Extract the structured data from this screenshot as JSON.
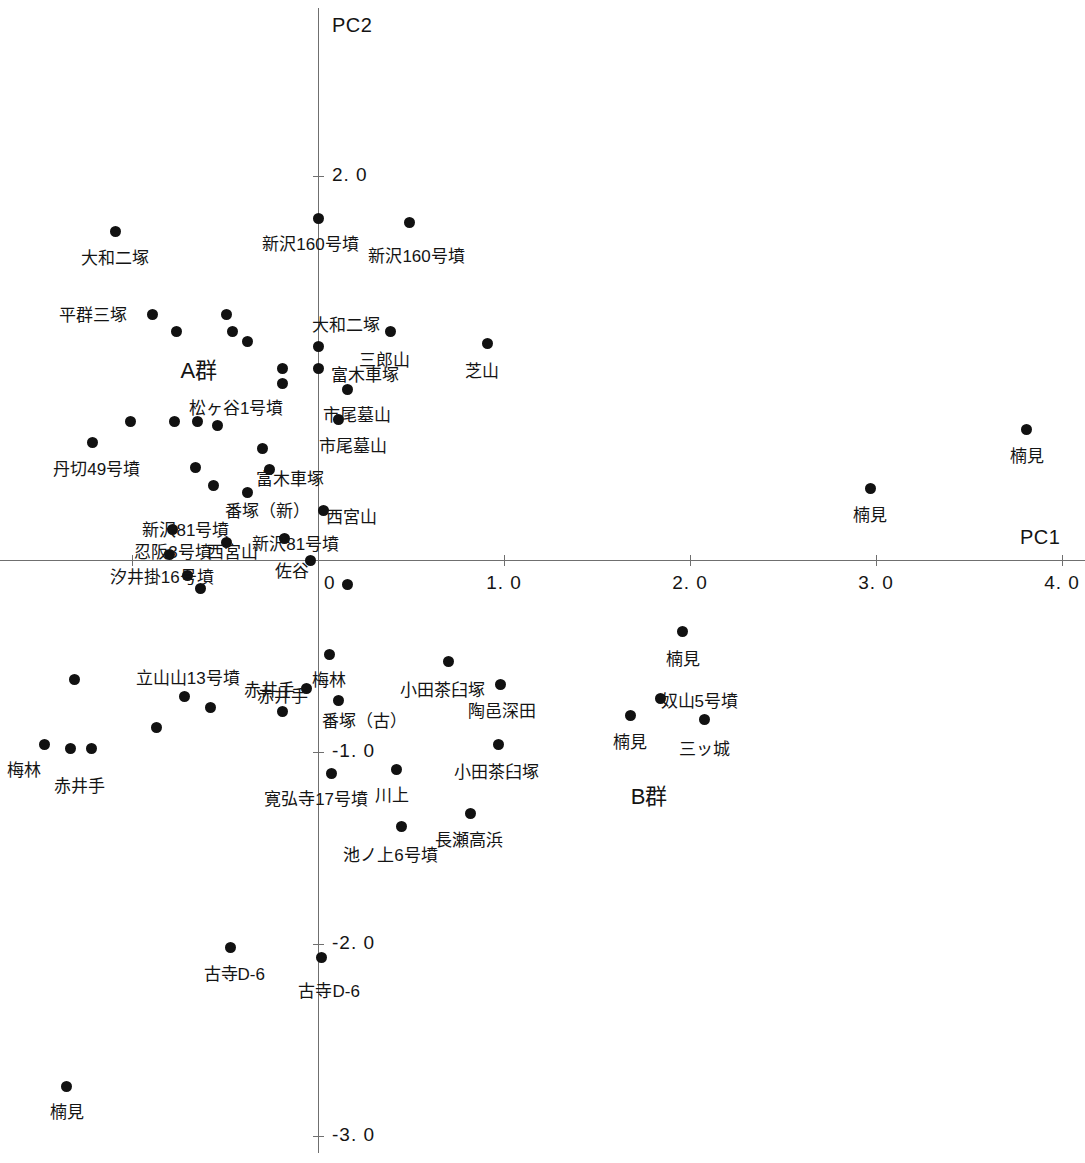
{
  "chart_data": {
    "type": "scatter",
    "title": "",
    "xlabel": "PC1",
    "ylabel": "PC2",
    "xlim": [
      -1.71,
      4.12
    ],
    "ylim": [
      -3.14,
      2.8
    ],
    "grid": false,
    "legend": null,
    "xticks": [
      {
        "value": 0,
        "label": "0"
      },
      {
        "value": 1.0,
        "label": "1. 0"
      },
      {
        "value": 2.0,
        "label": "2. 0"
      },
      {
        "value": 3.0,
        "label": "3. 0"
      },
      {
        "value": 4.0,
        "label": "4. 0"
      }
    ],
    "xticks_unlabeled": [
      -1.0
    ],
    "yticks": [
      {
        "value": 2.0,
        "label": "2. 0"
      },
      {
        "value": -1.0,
        "label": "-1. 0"
      },
      {
        "value": -2.0,
        "label": "-2. 0"
      },
      {
        "value": -3.0,
        "label": "-3. 0"
      }
    ],
    "cluster_annotations": [
      {
        "text": "A群",
        "x": -0.64,
        "y": 1.0
      },
      {
        "text": "B群",
        "x": 1.78,
        "y": -1.22
      }
    ],
    "points": [
      {
        "label": "大和二塚",
        "x": -1.09,
        "y": 1.71,
        "lx": -1.09,
        "ly": 1.6
      },
      {
        "label": "新沢160号墳",
        "x": 0.0,
        "y": 1.78,
        "lx": -0.04,
        "ly": 1.67
      },
      {
        "label": "新沢160号墳",
        "x": 0.49,
        "y": 1.76,
        "lx": 0.53,
        "ly": 1.61
      },
      {
        "label": "平群三塚",
        "x": -0.89,
        "y": 1.28,
        "lx": -1.21,
        "ly": 1.3
      },
      {
        "label": "",
        "x": -0.76,
        "y": 1.19,
        "lx": null,
        "ly": null
      },
      {
        "label": "",
        "x": -0.49,
        "y": 1.28,
        "lx": null,
        "ly": null
      },
      {
        "label": "",
        "x": -0.46,
        "y": 1.19,
        "lx": null,
        "ly": null
      },
      {
        "label": "",
        "x": -0.38,
        "y": 1.14,
        "lx": null,
        "ly": null
      },
      {
        "label": "大和二塚",
        "x": 0.0,
        "y": 1.11,
        "lx": 0.15,
        "ly": 1.25
      },
      {
        "label": "三郎山",
        "x": 0.39,
        "y": 1.19,
        "lx": 0.36,
        "ly": 1.07
      },
      {
        "label": "芝山",
        "x": 0.91,
        "y": 1.13,
        "lx": 0.88,
        "ly": 1.01
      },
      {
        "label": "",
        "x": -0.19,
        "y": 1.0,
        "lx": null,
        "ly": null
      },
      {
        "label": "富木車塚",
        "x": 0.0,
        "y": 1.0,
        "lx": 0.25,
        "ly": 0.99
      },
      {
        "label": "",
        "x": -0.19,
        "y": 0.92,
        "lx": null,
        "ly": null
      },
      {
        "label": "市尾墓山",
        "x": 0.16,
        "y": 0.89,
        "lx": 0.21,
        "ly": 0.78
      },
      {
        "label": "市尾墓山",
        "x": 0.11,
        "y": 0.73,
        "lx": 0.19,
        "ly": 0.62
      },
      {
        "label": "",
        "x": -1.01,
        "y": 0.72,
        "lx": null,
        "ly": null
      },
      {
        "label": "",
        "x": -0.77,
        "y": 0.72,
        "lx": null,
        "ly": null
      },
      {
        "label": "",
        "x": -0.65,
        "y": 0.72,
        "lx": null,
        "ly": null
      },
      {
        "label": "松ヶ谷1号墳",
        "x": -0.54,
        "y": 0.7,
        "lx": -0.44,
        "ly": 0.82
      },
      {
        "label": "丹切49号墳",
        "x": -1.21,
        "y": 0.61,
        "lx": -1.19,
        "ly": 0.5
      },
      {
        "label": "",
        "x": -0.3,
        "y": 0.58,
        "lx": null,
        "ly": null
      },
      {
        "label": "",
        "x": -0.66,
        "y": 0.48,
        "lx": null,
        "ly": null
      },
      {
        "label": "富木車塚",
        "x": -0.26,
        "y": 0.47,
        "lx": -0.15,
        "ly": 0.45
      },
      {
        "label": "",
        "x": -0.56,
        "y": 0.39,
        "lx": null,
        "ly": null
      },
      {
        "label": "番塚（新）",
        "x": -0.38,
        "y": 0.35,
        "lx": -0.27,
        "ly": 0.28
      },
      {
        "label": "西宮山",
        "x": 0.03,
        "y": 0.26,
        "lx": 0.18,
        "ly": 0.25
      },
      {
        "label": "新沢81号墳",
        "x": -0.78,
        "y": 0.16,
        "lx": -0.71,
        "ly": 0.18
      },
      {
        "label": "新沢81号墳",
        "x": -0.18,
        "y": 0.11,
        "lx": -0.12,
        "ly": 0.11
      },
      {
        "label": "忍阪3号墳",
        "x": -0.8,
        "y": 0.03,
        "lx": -0.78,
        "ly": 0.07
      },
      {
        "label": "西宮山",
        "x": -0.49,
        "y": 0.09,
        "lx": -0.46,
        "ly": 0.07
      },
      {
        "label": "佐谷",
        "x": -0.04,
        "y": 0.0,
        "lx": -0.14,
        "ly": -0.03
      },
      {
        "label": "汐井掛16号墳",
        "x": -0.7,
        "y": -0.08,
        "lx": -0.84,
        "ly": -0.06
      },
      {
        "label": "",
        "x": -0.63,
        "y": -0.15,
        "lx": null,
        "ly": null
      },
      {
        "label": "",
        "x": 0.16,
        "y": -0.13,
        "lx": null,
        "ly": null
      },
      {
        "label": "楠見",
        "x": 3.81,
        "y": 0.68,
        "lx": 3.81,
        "ly": 0.57
      },
      {
        "label": "楠見",
        "x": 2.97,
        "y": 0.37,
        "lx": 2.97,
        "ly": 0.26
      },
      {
        "label": "梅林",
        "x": 0.06,
        "y": -0.49,
        "lx": 0.06,
        "ly": -0.6
      },
      {
        "label": "赤井手",
        "x": -0.06,
        "y": -0.67,
        "lx": -0.26,
        "ly": -0.65
      },
      {
        "label": "番塚（古）",
        "x": 0.11,
        "y": -0.73,
        "lx": 0.25,
        "ly": -0.81
      },
      {
        "label": "小田茶臼塚",
        "x": 0.7,
        "y": -0.53,
        "lx": 0.67,
        "ly": -0.65
      },
      {
        "label": "陶邑深田",
        "x": 0.98,
        "y": -0.65,
        "lx": 0.99,
        "ly": -0.76
      },
      {
        "label": "立山山13号墳",
        "x": -0.72,
        "y": -0.71,
        "lx": -0.7,
        "ly": -0.59
      },
      {
        "label": "",
        "x": -0.58,
        "y": -0.77,
        "lx": null,
        "ly": null
      },
      {
        "label": "",
        "x": -0.87,
        "y": -0.87,
        "lx": null,
        "ly": null
      },
      {
        "label": "",
        "x": -1.31,
        "y": -0.62,
        "lx": null,
        "ly": null
      },
      {
        "label": "赤井手",
        "x": -0.19,
        "y": -0.79,
        "lx": -0.19,
        "ly": -0.68
      },
      {
        "label": "楠見",
        "x": 1.96,
        "y": -0.37,
        "lx": 1.96,
        "ly": -0.49
      },
      {
        "label": "奴山5号墳",
        "x": 1.84,
        "y": -0.72,
        "lx": 2.05,
        "ly": -0.71
      },
      {
        "label": "楠見",
        "x": 1.68,
        "y": -0.81,
        "lx": 1.68,
        "ly": -0.92
      },
      {
        "label": "三ッ城",
        "x": 2.08,
        "y": -0.83,
        "lx": 2.08,
        "ly": -0.96
      },
      {
        "label": "梅林",
        "x": -1.47,
        "y": -0.96,
        "lx": -1.58,
        "ly": -1.07
      },
      {
        "label": "赤井手",
        "x": -1.33,
        "y": -0.98,
        "lx": -1.28,
        "ly": -1.15
      },
      {
        "label": "",
        "x": -1.22,
        "y": -0.98,
        "lx": null,
        "ly": null
      },
      {
        "label": "小田茶臼塚",
        "x": 0.97,
        "y": -0.96,
        "lx": 0.96,
        "ly": -1.08
      },
      {
        "label": "寛弘寺17号墳",
        "x": 0.07,
        "y": -1.11,
        "lx": -0.01,
        "ly": -1.22
      },
      {
        "label": "川上",
        "x": 0.42,
        "y": -1.09,
        "lx": 0.4,
        "ly": -1.2
      },
      {
        "label": "長瀬高浜",
        "x": 0.82,
        "y": -1.32,
        "lx": 0.81,
        "ly": -1.43
      },
      {
        "label": "池ノ上6号墳",
        "x": 0.45,
        "y": -1.39,
        "lx": 0.39,
        "ly": -1.51
      },
      {
        "label": "古寺D-6",
        "x": -0.47,
        "y": -2.02,
        "lx": -0.45,
        "ly": -2.13
      },
      {
        "label": "古寺D-6",
        "x": 0.02,
        "y": -2.07,
        "lx": 0.06,
        "ly": -2.22
      },
      {
        "label": "楠見",
        "x": -1.35,
        "y": -2.74,
        "lx": -1.35,
        "ly": -2.85
      }
    ]
  }
}
